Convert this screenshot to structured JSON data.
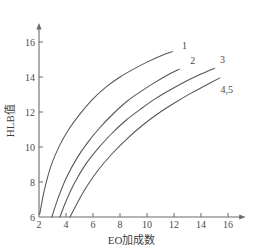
{
  "chart_data": {
    "type": "line",
    "title": "",
    "xlabel": "EO加成数",
    "ylabel": "HLB值",
    "xlim": [
      2,
      17.2
    ],
    "ylim": [
      6,
      17.0
    ],
    "xticks": [
      "2",
      "4",
      "6",
      "8",
      "10",
      "12",
      "14",
      "16"
    ],
    "xtick_values": [
      2,
      4,
      6,
      8,
      10,
      12,
      14,
      16
    ],
    "yticks": [
      "6",
      "8",
      "10",
      "12",
      "14",
      "16"
    ],
    "ytick_values": [
      6,
      8,
      10,
      12,
      14,
      16
    ],
    "grid": false,
    "legend": "inline-end-labels",
    "axis_arrows": true,
    "line_color": "#555555",
    "axis_color": "#6b6b6b",
    "series": [
      {
        "name": "1",
        "label": "1",
        "label_x": 12.6,
        "label_y": 15.8,
        "x": [
          2.05,
          2.4,
          2.9,
          3.5,
          4.2,
          5.0,
          6.0,
          7.0,
          8.0,
          9.0,
          10.0,
          11.0,
          11.9
        ],
        "y": [
          6.15,
          7.55,
          8.95,
          10.05,
          11.0,
          11.85,
          12.75,
          13.45,
          14.0,
          14.45,
          14.85,
          15.2,
          15.45
        ]
      },
      {
        "name": "2",
        "label": "2",
        "label_x": 13.2,
        "label_y": 14.95,
        "x": [
          2.95,
          3.4,
          4.0,
          4.8,
          5.6,
          6.5,
          7.5,
          8.5,
          9.5,
          10.5,
          11.5,
          12.4
        ],
        "y": [
          6.0,
          7.05,
          8.2,
          9.35,
          10.25,
          11.1,
          11.9,
          12.6,
          13.15,
          13.65,
          14.1,
          14.45
        ]
      },
      {
        "name": "3",
        "label": "3",
        "label_x": 15.4,
        "label_y": 15.0,
        "x": [
          3.55,
          4.0,
          4.6,
          5.4,
          6.3,
          7.3,
          8.4,
          9.5,
          10.6,
          11.8,
          13.0,
          14.1,
          15.0
        ],
        "y": [
          6.0,
          6.9,
          7.9,
          8.95,
          9.85,
          10.7,
          11.5,
          12.15,
          12.75,
          13.3,
          13.8,
          14.2,
          14.5
        ]
      },
      {
        "name": "4,5",
        "label": "4,5",
        "label_x": 15.45,
        "label_y": 13.3,
        "x": [
          4.3,
          4.8,
          5.5,
          6.4,
          7.4,
          8.5,
          9.6,
          10.8,
          12.0,
          13.2,
          14.3,
          15.4
        ],
        "y": [
          6.0,
          6.75,
          7.7,
          8.7,
          9.6,
          10.45,
          11.2,
          11.9,
          12.5,
          13.05,
          13.5,
          13.95
        ]
      }
    ]
  }
}
